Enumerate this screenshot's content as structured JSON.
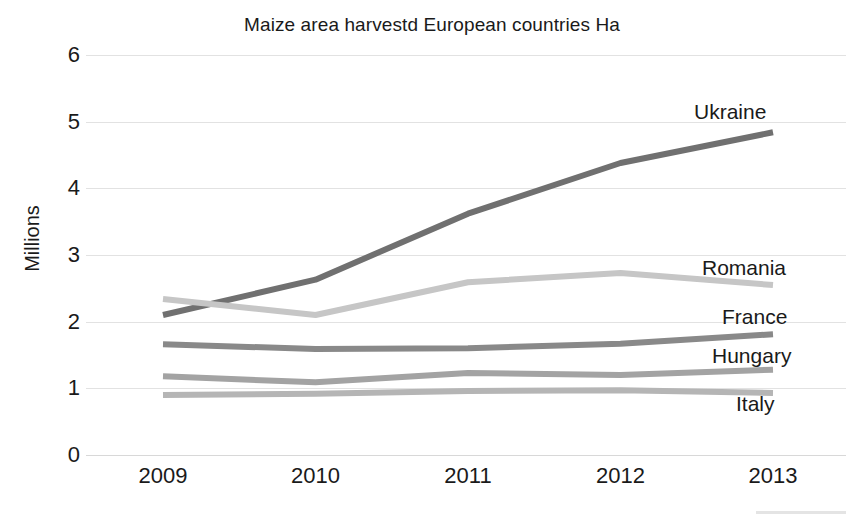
{
  "chart_data": {
    "type": "line",
    "title": "Maize area harvestd European countries Ha",
    "xlabel": "",
    "ylabel": "Millions",
    "categories": [
      "2009",
      "2010",
      "2011",
      "2012",
      "2013"
    ],
    "ylim": [
      0,
      6
    ],
    "yticks": [
      "0",
      "1",
      "2",
      "3",
      "4",
      "5",
      "6"
    ],
    "grid": true,
    "legend_position": "right-inline-labels",
    "series": [
      {
        "name": "Ukraine",
        "color": "#707070",
        "values": [
          2.1,
          2.63,
          3.62,
          4.38,
          4.84
        ]
      },
      {
        "name": "Romania",
        "color": "#c6c6c6",
        "values": [
          2.34,
          2.1,
          2.59,
          2.73,
          2.55
        ]
      },
      {
        "name": "France",
        "color": "#898989",
        "values": [
          1.66,
          1.59,
          1.6,
          1.67,
          1.81
        ]
      },
      {
        "name": "Hungary",
        "color": "#a3a3a3",
        "values": [
          1.18,
          1.09,
          1.23,
          1.2,
          1.28
        ]
      },
      {
        "name": "Italy",
        "color": "#b5b5b5",
        "values": [
          0.9,
          0.92,
          0.96,
          0.97,
          0.93
        ]
      }
    ],
    "annotations": [
      {
        "text": "Ukraine",
        "series": "Ukraine"
      },
      {
        "text": "Romania",
        "series": "Romania"
      },
      {
        "text": "France",
        "series": "France"
      },
      {
        "text": "Hungary",
        "series": "Hungary"
      },
      {
        "text": "Italy",
        "series": "Italy"
      }
    ]
  },
  "axis": {
    "y_title": "Millions",
    "y_ticks": [
      "6",
      "5",
      "4",
      "3",
      "2",
      "1",
      "0"
    ],
    "x_ticks": [
      "2009",
      "2010",
      "2011",
      "2012",
      "2013"
    ]
  },
  "labels": {
    "ukraine": "Ukraine",
    "romania": "Romania",
    "france": "France",
    "hungary": "Hungary",
    "italy": "Italy"
  },
  "colors": {
    "background": "#ffffff",
    "gridline": "#e2e2e2",
    "text": "#1a1a1a"
  }
}
